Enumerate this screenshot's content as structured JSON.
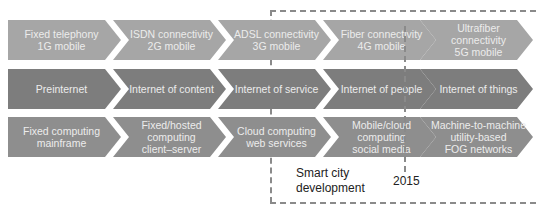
{
  "colors": {
    "row1": "#a6a6a6",
    "row2": "#7d7d7d",
    "row3": "#8e8e8e",
    "text": "#ececec",
    "dashes": "#8a8a8a"
  },
  "rows": [
    {
      "name": "connectivity",
      "items": [
        {
          "label": "Fixed telephony\n1G mobile"
        },
        {
          "label": "ISDN connectivity\n2G mobile"
        },
        {
          "label": "ADSL connectivity\n3G mobile"
        },
        {
          "label": "Fiber connectivity\n4G mobile"
        },
        {
          "label": "Ultrafiber connectivity\n5G mobile"
        }
      ]
    },
    {
      "name": "internet",
      "items": [
        {
          "label": "Preinternet"
        },
        {
          "label": "Internet of content"
        },
        {
          "label": "Internet of service"
        },
        {
          "label": "Internet of people"
        },
        {
          "label": "Internet of things"
        }
      ]
    },
    {
      "name": "computing",
      "items": [
        {
          "label": "Fixed computing\nmainframe"
        },
        {
          "label": "Fixed/hosted\ncomputing\nclient–server"
        },
        {
          "label": "Cloud computing\nweb services"
        },
        {
          "label": "Mobile/cloud\ncomputing\nsocial media"
        },
        {
          "label": "Machine-to-machine\nutility-based\nFOG networks"
        }
      ]
    }
  ],
  "annotations": {
    "smart_city": "Smart city\ndevelopment",
    "year": "2015"
  }
}
